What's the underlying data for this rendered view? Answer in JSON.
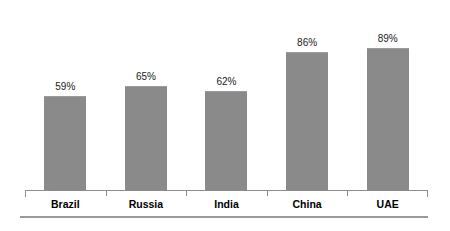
{
  "chart_data": {
    "type": "bar",
    "title": "",
    "subtitle": "",
    "xlabel": "",
    "ylabel": "",
    "ylim": [
      0,
      100
    ],
    "grid": false,
    "legend": false,
    "value_label_suffix": "%",
    "categories": [
      "Brazil",
      "Russia",
      "India",
      "China",
      "UAE"
    ],
    "values": [
      59,
      65,
      62,
      86,
      89
    ],
    "value_labels": [
      "59%",
      "65%",
      "62%",
      "86%",
      "89%"
    ],
    "bar_color": "#8a8a8a",
    "axis_color": "#8c8c8c",
    "label_color": "#000000",
    "value_text_color": "#1a1a1a",
    "background_color": "#ffffff"
  },
  "axis": {
    "tick_count": 4
  }
}
